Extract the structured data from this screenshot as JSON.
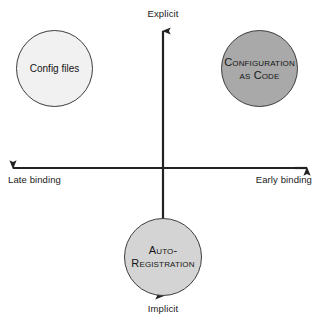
{
  "diagram": {
    "type": "quadrant-scatter",
    "title": "",
    "background_color": "#ffffff",
    "axes": {
      "vertical": {
        "name": "explicitness-axis",
        "top_label": "Explicit",
        "bottom_label": "Implicit",
        "color": "#222222",
        "arrow_both_ends": true,
        "x_position": 163,
        "top_y": 26,
        "bottom_y": 300
      },
      "horizontal": {
        "name": "binding-axis",
        "left_label": "Late binding",
        "right_label": "Early binding",
        "color": "#222222",
        "arrow_both_ends": true,
        "y_position": 168,
        "left_x": 8,
        "right_x": 312
      }
    },
    "nodes": [
      {
        "id": "config-files",
        "label": "Config files",
        "label_lines": [
          "Config files"
        ],
        "style": "plain",
        "quadrant": "upper-left",
        "fill": "#f1f1f1",
        "stroke": "#3d3d3d",
        "cx": 54.5,
        "cy": 68.5,
        "r": 38.5
      },
      {
        "id": "configuration-as-code",
        "label": "Configuration as Code",
        "label_lines": [
          "Configuration",
          "as Code"
        ],
        "style": "small-caps",
        "quadrant": "upper-right",
        "fill": "#a9a9a9",
        "stroke": "#3d3d3d",
        "cx": 259.5,
        "cy": 68.5,
        "r": 38.5
      },
      {
        "id": "auto-registration",
        "label": "Auto-Registration",
        "label_lines": [
          "Auto-",
          "Registration"
        ],
        "style": "small-caps",
        "quadrant": "lower-center",
        "fill": "#d4d4d4",
        "stroke": "#3d3d3d",
        "cx": 163,
        "cy": 257,
        "r": 39
      }
    ]
  }
}
